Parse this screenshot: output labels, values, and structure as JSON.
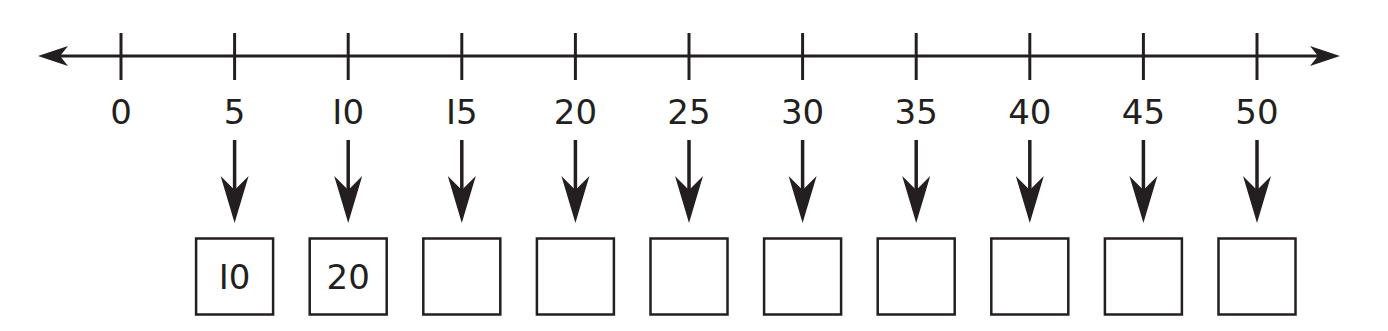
{
  "number_line": {
    "start": 0,
    "end": 50,
    "step": 5,
    "tick_labels": [
      "0",
      "5",
      "I0",
      "I5",
      "20",
      "25",
      "30",
      "35",
      "40",
      "45",
      "50"
    ],
    "arrows_both_ends": true
  },
  "answer_boxes": [
    {
      "points_to": "5",
      "value": "I0"
    },
    {
      "points_to": "I0",
      "value": "20"
    },
    {
      "points_to": "I5",
      "value": ""
    },
    {
      "points_to": "20",
      "value": ""
    },
    {
      "points_to": "25",
      "value": ""
    },
    {
      "points_to": "30",
      "value": ""
    },
    {
      "points_to": "35",
      "value": ""
    },
    {
      "points_to": "40",
      "value": ""
    },
    {
      "points_to": "45",
      "value": ""
    },
    {
      "points_to": "50",
      "value": ""
    }
  ],
  "colors": {
    "ink": "#231f20",
    "background": "#ffffff"
  }
}
